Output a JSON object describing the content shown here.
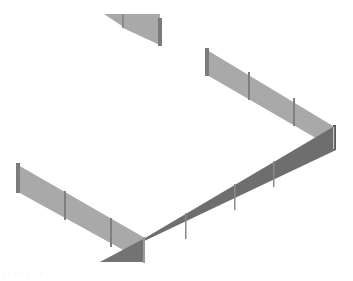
{
  "scene": {
    "description": "Isometric render of segmented wall/fence panels forming a partial rectangular enclosure",
    "colors": {
      "background": "#ffffff",
      "panel_light": "#a9a9a9",
      "panel_dark": "#6e6e6e",
      "post_light": "#8a8a8a",
      "post_dark": "#5a5a5a",
      "post_highlight": "#c8c8c8"
    },
    "walls": [
      {
        "id": "top-fragment",
        "shade": "light"
      },
      {
        "id": "right-back-wall",
        "shade": "light",
        "panels": 3
      },
      {
        "id": "left-wall",
        "shade": "light",
        "panels": 3
      },
      {
        "id": "front-wall",
        "shade": "dark",
        "panels": 5
      }
    ]
  },
  "caption": {
    "text": "· · ·  ·   ·  · ·"
  }
}
